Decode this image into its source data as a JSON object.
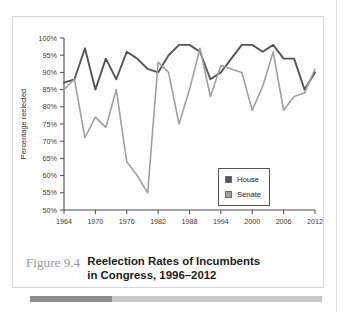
{
  "figure": {
    "number_label": "Figure 9.4",
    "caption_line1": "Reelection Rates of Incumbents",
    "caption_line2": "in Congress, 1996–2012"
  },
  "legend": {
    "position": "bottom-right-inside",
    "entries": [
      {
        "label": "House",
        "color": "#555555"
      },
      {
        "label": "Senate",
        "color": "#a0a0a0"
      }
    ]
  },
  "axes": {
    "y_title": "Percentage reelected",
    "y_ticks": [
      "50%",
      "55%",
      "60%",
      "65%",
      "70%",
      "75%",
      "80%",
      "85%",
      "90%",
      "95%",
      "100%"
    ],
    "x_ticks": [
      "1964",
      "1970",
      "1976",
      "1982",
      "1988",
      "1994",
      "2000",
      "2006",
      "2012"
    ]
  },
  "chart_data": {
    "type": "line",
    "title": "Reelection Rates of Incumbents in Congress, 1996–2012",
    "xlabel": "",
    "ylabel": "Percentage reelected",
    "ylim": [
      50,
      100
    ],
    "xlim": [
      1964,
      2012
    ],
    "y_tick_values": [
      50,
      55,
      60,
      65,
      70,
      75,
      80,
      85,
      90,
      95,
      100
    ],
    "x_tick_values": [
      1964,
      1970,
      1976,
      1982,
      1988,
      1994,
      2000,
      2006,
      2012
    ],
    "grid": false,
    "legend": [
      "House",
      "Senate"
    ],
    "x": [
      1964,
      1966,
      1968,
      1970,
      1972,
      1974,
      1976,
      1978,
      1980,
      1982,
      1984,
      1986,
      1988,
      1990,
      1992,
      1994,
      1996,
      1998,
      2000,
      2002,
      2004,
      2006,
      2008,
      2010,
      2012
    ],
    "series": [
      {
        "name": "House",
        "color": "#555555",
        "values": [
          87,
          88,
          97,
          85,
          94,
          88,
          96,
          94,
          91,
          90,
          95,
          98,
          98,
          96,
          88,
          90,
          94,
          98,
          98,
          96,
          98,
          94,
          94,
          85,
          90
        ]
      },
      {
        "name": "Senate",
        "color": "#a0a0a0",
        "values": [
          85,
          88,
          71,
          77,
          74,
          85,
          64,
          60,
          55,
          93,
          90,
          75,
          85,
          97,
          83,
          92,
          91,
          90,
          79,
          86,
          96,
          79,
          83,
          84,
          91
        ]
      }
    ]
  },
  "rule_bar": {
    "dark_width_percent": 28,
    "dark_color": "#8d8d8d",
    "light_color": "#c9c9c9"
  }
}
